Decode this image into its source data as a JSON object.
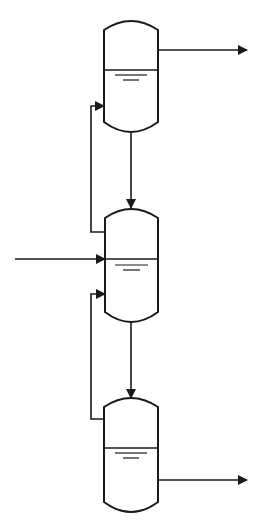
{
  "diagram": {
    "type": "process-flow",
    "colors": {
      "stroke": "#1a1a1a",
      "background": "#ffffff"
    },
    "vessels": [
      {
        "id": "vessel-1",
        "x": 104,
        "top": 20,
        "width": 54,
        "height": 113,
        "liquid_y": 70
      },
      {
        "id": "vessel-2",
        "x": 105,
        "top": 208,
        "width": 53,
        "height": 114,
        "liquid_y": 259
      },
      {
        "id": "vessel-3",
        "x": 104,
        "top": 398,
        "width": 54,
        "height": 114,
        "liquid_y": 448
      }
    ],
    "streams": [
      {
        "id": "top-outlet",
        "from": "vessel-1",
        "y": 50,
        "x_end": 247
      },
      {
        "id": "feed-inlet",
        "to": "vessel-2",
        "y": 259,
        "x_start": 15
      },
      {
        "id": "bottom-outlet",
        "from": "vessel-3",
        "y": 480,
        "x_end": 247
      },
      {
        "id": "v1-to-v2",
        "x": 131
      },
      {
        "id": "v2-to-v3",
        "x": 131
      },
      {
        "id": "v2-to-v1-recycle",
        "x": 91
      },
      {
        "id": "v3-to-v2-recycle",
        "x": 91
      }
    ]
  }
}
